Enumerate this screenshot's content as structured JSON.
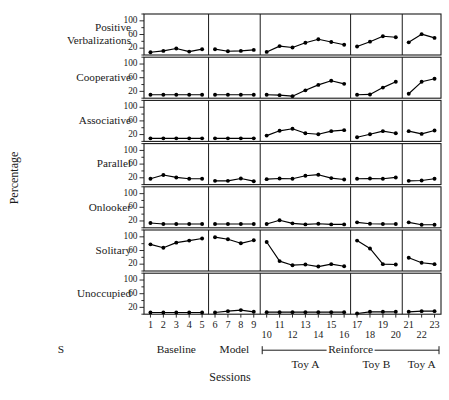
{
  "figure": {
    "y_axis_title": "Percentage",
    "x_axis_title": "Sessions",
    "subject_label": "S"
  },
  "chart_data": {
    "type": "line",
    "title": "",
    "xlabel": "Sessions",
    "ylabel": "Percentage",
    "ylim": [
      0,
      120
    ],
    "yticks": [
      20,
      60,
      100
    ],
    "grid": false,
    "legend": "none",
    "layout": "7 stacked panel rows x 5 phase columns sharing one session x-axis",
    "x": [
      1,
      2,
      3,
      4,
      5,
      6,
      7,
      8,
      9,
      10,
      11,
      12,
      13,
      14,
      15,
      16,
      17,
      18,
      19,
      20,
      21,
      22,
      23
    ],
    "xtick_labels": [
      "1",
      "2",
      "3",
      "4",
      "5",
      "6",
      "7",
      "8",
      "9",
      "10",
      "11",
      "12",
      "13",
      "14",
      "15",
      "16",
      "17",
      "18",
      "19",
      "20",
      "21",
      "22",
      "23"
    ],
    "phases": [
      {
        "name": "Baseline",
        "sessions": [
          1,
          2,
          3,
          4,
          5
        ],
        "sublabel": ""
      },
      {
        "name": "Model",
        "sessions": [
          6,
          7,
          8,
          9
        ],
        "sublabel": ""
      },
      {
        "name": "Reinforce",
        "sessions": [
          10,
          11,
          12,
          13,
          14,
          15,
          16
        ],
        "sublabel": "Toy A"
      },
      {
        "name": "Reinforce",
        "sessions": [
          17,
          18,
          19,
          20
        ],
        "sublabel": "Toy B"
      },
      {
        "name": "Reinforce",
        "sessions": [
          21,
          22,
          23
        ],
        "sublabel": "Toy A"
      }
    ],
    "phase_bracket_label": "Reinforce",
    "series": [
      {
        "name": "Positive Verbalizations",
        "values": [
          8,
          12,
          19,
          10,
          17,
          17,
          11,
          12,
          15,
          9,
          26,
          22,
          36,
          46,
          38,
          30,
          25,
          39,
          55,
          52,
          37,
          61,
          50
        ]
      },
      {
        "name": "Cooperative",
        "values": [
          10,
          10,
          10,
          10,
          10,
          10,
          10,
          10,
          10,
          10,
          9,
          6,
          23,
          39,
          51,
          42,
          10,
          11,
          31,
          48,
          13,
          48,
          57
        ]
      },
      {
        "name": "Associative",
        "values": [
          9,
          9,
          9,
          9,
          9,
          9,
          9,
          9,
          9,
          17,
          31,
          37,
          24,
          21,
          30,
          33,
          12,
          21,
          30,
          24,
          30,
          22,
          32
        ]
      },
      {
        "name": "Parallel",
        "values": [
          17,
          28,
          21,
          17,
          17,
          11,
          11,
          18,
          10,
          16,
          18,
          17,
          26,
          29,
          19,
          15,
          17,
          18,
          17,
          21,
          11,
          12,
          17
        ]
      },
      {
        "name": "Onlooker",
        "values": [
          14,
          11,
          11,
          11,
          11,
          11,
          11,
          11,
          11,
          11,
          22,
          13,
          10,
          12,
          10,
          10,
          16,
          12,
          11,
          11,
          16,
          9,
          9
        ]
      },
      {
        "name": "Solitary",
        "values": [
          78,
          68,
          83,
          89,
          95,
          99,
          93,
          81,
          90,
          85,
          29,
          17,
          19,
          13,
          20,
          14,
          89,
          66,
          20,
          19,
          39,
          24,
          20
        ]
      },
      {
        "name": "Unoccupied",
        "values": [
          5,
          5,
          5,
          5,
          5,
          5,
          9,
          12,
          7,
          6,
          6,
          6,
          6,
          6,
          6,
          6,
          2,
          7,
          7,
          7,
          7,
          9,
          9
        ]
      }
    ]
  }
}
